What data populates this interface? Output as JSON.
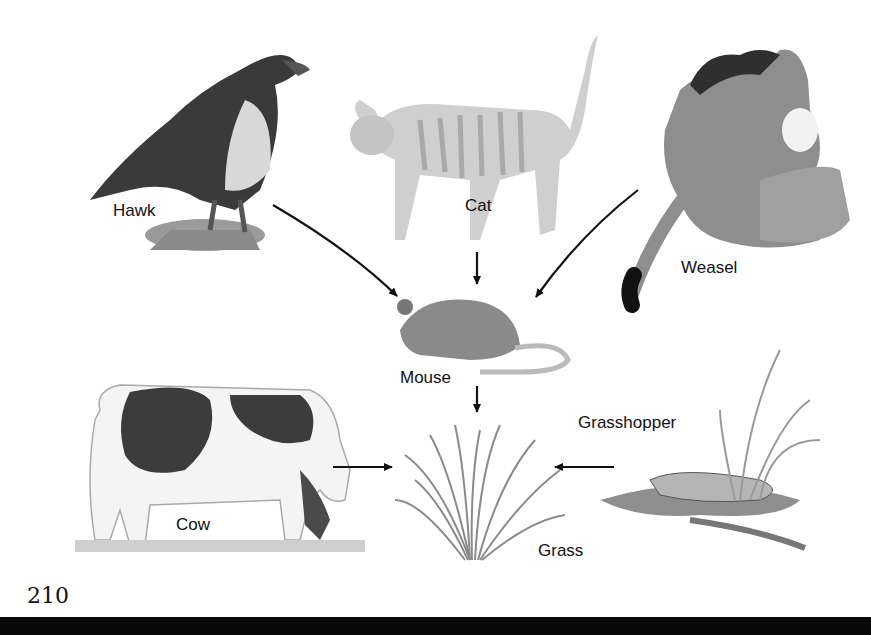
{
  "diagram": {
    "type": "food-web",
    "nodes": [
      {
        "id": "hawk",
        "label": "Hawk"
      },
      {
        "id": "cat",
        "label": "Cat"
      },
      {
        "id": "weasel",
        "label": "Weasel"
      },
      {
        "id": "mouse",
        "label": "Mouse"
      },
      {
        "id": "cow",
        "label": "Cow"
      },
      {
        "id": "grass",
        "label": "Grass"
      },
      {
        "id": "grasshopper",
        "label": "Grasshopper"
      }
    ],
    "edges": [
      {
        "from": "hawk",
        "to": "mouse"
      },
      {
        "from": "cat",
        "to": "mouse"
      },
      {
        "from": "weasel",
        "to": "mouse"
      },
      {
        "from": "mouse",
        "to": "grass"
      },
      {
        "from": "cow",
        "to": "grass"
      },
      {
        "from": "grasshopper",
        "to": "grass"
      }
    ]
  },
  "labels": {
    "hawk": "Hawk",
    "cat": "Cat",
    "weasel": "Weasel",
    "mouse": "Mouse",
    "cow": "Cow",
    "grass": "Grass",
    "grasshopper": "Grasshopper"
  },
  "page": {
    "number": "210"
  }
}
